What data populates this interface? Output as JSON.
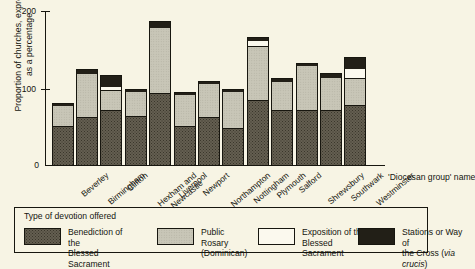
{
  "chart_data": {
    "type": "bar",
    "stacked": true,
    "title": "",
    "xlabel": "'Diocesan group' name",
    "ylabel": "Proportion of churches, expressed\nas a percentage",
    "ylim": [
      0,
      200
    ],
    "yticks": [
      0,
      100,
      200
    ],
    "ytick_labels": [
      "0",
      "100",
      "200"
    ],
    "grid": false,
    "legend_position": "bottom",
    "legend_title": "Type of devotion offered",
    "categories": [
      "Beverley",
      "Birmingham",
      "Clifton",
      "Hexham and\nNewcastle",
      "Liverpool",
      "Newport",
      "Northampton",
      "Nottingham",
      "Plymouth",
      "Salford",
      "Shrewsbury",
      "Southwark",
      "Westminster"
    ],
    "series": [
      {
        "name": "Benediction of the\nBlessed Sacrament",
        "color": "#645f51",
        "values": [
          52,
          63,
          72,
          64,
          94,
          52,
          63,
          49,
          85,
          72,
          72,
          72,
          79
        ]
      },
      {
        "name": "Public Rosary\n(Dominican)",
        "color": "#c8c6b7",
        "values": [
          27,
          58,
          26,
          34,
          86,
          42,
          45,
          49,
          71,
          39,
          59,
          44,
          35
        ]
      },
      {
        "name": "Exposition of the\nBlessed Sacrament",
        "color": "#fbf9ee",
        "values": [
          0,
          0,
          6,
          0,
          0,
          0,
          0,
          0,
          7,
          0,
          0,
          0,
          13
        ]
      },
      {
        "name": "Stations or Way of\nthe Cross (via crucis)",
        "color": "#221f17",
        "values": [
          3,
          5,
          14,
          2,
          8,
          2,
          2,
          2,
          4,
          3,
          3,
          5,
          15
        ]
      }
    ],
    "totals": [
      82,
      126,
      118,
      100,
      188,
      96,
      110,
      100,
      167,
      114,
      134,
      121,
      142
    ]
  },
  "legend": {
    "title": "Type of devotion offered",
    "items": [
      {
        "label": "Benediction of the\nBlessed Sacrament",
        "swatch": "benediction"
      },
      {
        "label": "Public Rosary\n(Dominican)",
        "swatch": "rosary"
      },
      {
        "label": "Exposition of the\nBlessed Sacrament",
        "swatch": "exposition"
      },
      {
        "label": "Stations or Way of\nthe Cross (",
        "label_italic": "via crucis",
        "label_tail": ")",
        "swatch": "cross"
      }
    ]
  },
  "axes": {
    "y_title": "Proportion of churches, expressed\nas a percentage",
    "x_title": "'Diocesan group' name",
    "y_ticks": [
      "200",
      "100",
      "0"
    ]
  }
}
